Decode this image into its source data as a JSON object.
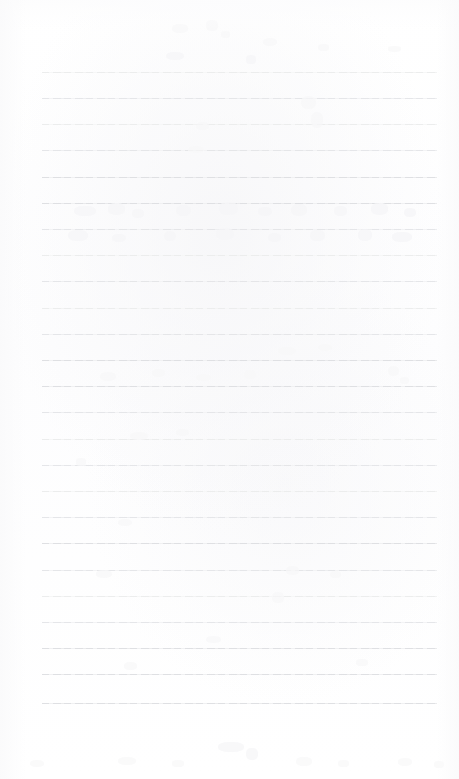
{
  "document": {
    "kind": "scanned-ruled-notepad-page",
    "title": "Blank Lined Paper Scan",
    "visible_text": "",
    "text_content_note": "no legible text present",
    "page_width": 459,
    "page_height": 779
  },
  "colors": {
    "page_background": "#fefefe",
    "paper_tint": "#fdfdfe",
    "rule_line": "#e8e9eb",
    "rule_line_dim": "#eceded",
    "rule_line_mid": "#e4e5e8",
    "rule_line_dark": "#dedfe2",
    "ghost_mark": "#f2f2f4"
  },
  "ruling": {
    "line_count": 25,
    "first_line_y": 72,
    "line_spacing": 26.2,
    "line_left_x": 42,
    "line_right_x": 437,
    "line_width": 395,
    "line_thickness": 1,
    "top_margin_height": 72,
    "bottom_margin_height": 76,
    "lines_y": [
      72,
      98,
      124,
      150,
      177,
      203,
      229,
      255,
      281,
      308,
      334,
      360,
      386,
      412,
      439,
      465,
      491,
      517,
      543,
      570,
      596,
      622,
      648,
      674,
      703
    ],
    "line_shades": [
      "dim",
      "mid",
      "dim",
      "mid",
      "dark",
      "dark",
      "mid",
      "dim",
      "mid",
      "dim",
      "mid",
      "dark",
      "dark",
      "mid",
      "dim",
      "mid",
      "dim",
      "mid",
      "dark",
      "mid",
      "dim",
      "mid",
      "dark",
      "dark",
      "dark"
    ]
  },
  "ghost_marks": [
    {
      "x": 172,
      "y": 24,
      "w": 16,
      "h": 9,
      "class": "faint"
    },
    {
      "x": 206,
      "y": 20,
      "w": 12,
      "h": 11,
      "class": "faint"
    },
    {
      "x": 221,
      "y": 31,
      "w": 9,
      "h": 7,
      "class": "faint"
    },
    {
      "x": 263,
      "y": 38,
      "w": 14,
      "h": 8,
      "class": "faint"
    },
    {
      "x": 318,
      "y": 44,
      "w": 11,
      "h": 7,
      "class": "faint"
    },
    {
      "x": 388,
      "y": 46,
      "w": 13,
      "h": 6,
      "class": "faint"
    },
    {
      "x": 166,
      "y": 52,
      "w": 18,
      "h": 8,
      "class": "soft"
    },
    {
      "x": 246,
      "y": 55,
      "w": 10,
      "h": 9,
      "class": "soft"
    },
    {
      "x": 301,
      "y": 96,
      "w": 15,
      "h": 13,
      "class": "faint"
    },
    {
      "x": 311,
      "y": 112,
      "w": 12,
      "h": 16,
      "class": "faint"
    },
    {
      "x": 196,
      "y": 122,
      "w": 13,
      "h": 8,
      "class": "faint"
    },
    {
      "x": 188,
      "y": 146,
      "w": 16,
      "h": 7,
      "class": "faint"
    },
    {
      "x": 74,
      "y": 206,
      "w": 22,
      "h": 10,
      "class": "soft"
    },
    {
      "x": 108,
      "y": 203,
      "w": 17,
      "h": 12,
      "class": "soft"
    },
    {
      "x": 132,
      "y": 209,
      "w": 12,
      "h": 9,
      "class": "soft"
    },
    {
      "x": 176,
      "y": 205,
      "w": 15,
      "h": 11,
      "class": "soft"
    },
    {
      "x": 219,
      "y": 202,
      "w": 19,
      "h": 13,
      "class": "soft"
    },
    {
      "x": 258,
      "y": 207,
      "w": 14,
      "h": 9,
      "class": "soft"
    },
    {
      "x": 291,
      "y": 204,
      "w": 16,
      "h": 12,
      "class": "soft"
    },
    {
      "x": 334,
      "y": 206,
      "w": 13,
      "h": 10,
      "class": "soft"
    },
    {
      "x": 371,
      "y": 203,
      "w": 17,
      "h": 12,
      "class": "soft"
    },
    {
      "x": 404,
      "y": 208,
      "w": 12,
      "h": 9,
      "class": "soft"
    },
    {
      "x": 68,
      "y": 230,
      "w": 20,
      "h": 11,
      "class": "soft"
    },
    {
      "x": 112,
      "y": 234,
      "w": 14,
      "h": 8,
      "class": "soft"
    },
    {
      "x": 164,
      "y": 231,
      "w": 12,
      "h": 10,
      "class": "soft"
    },
    {
      "x": 216,
      "y": 228,
      "w": 18,
      "h": 12,
      "class": "soft"
    },
    {
      "x": 268,
      "y": 233,
      "w": 13,
      "h": 9,
      "class": "soft"
    },
    {
      "x": 310,
      "y": 230,
      "w": 15,
      "h": 11,
      "class": "soft"
    },
    {
      "x": 358,
      "y": 229,
      "w": 14,
      "h": 12,
      "class": "soft"
    },
    {
      "x": 392,
      "y": 232,
      "w": 20,
      "h": 10,
      "class": "soft"
    },
    {
      "x": 278,
      "y": 347,
      "w": 18,
      "h": 8,
      "class": "faint"
    },
    {
      "x": 318,
      "y": 344,
      "w": 14,
      "h": 7,
      "class": "faint"
    },
    {
      "x": 100,
      "y": 372,
      "w": 16,
      "h": 9,
      "class": "faint"
    },
    {
      "x": 152,
      "y": 369,
      "w": 13,
      "h": 8,
      "class": "faint"
    },
    {
      "x": 196,
      "y": 374,
      "w": 15,
      "h": 7,
      "class": "faint"
    },
    {
      "x": 244,
      "y": 370,
      "w": 12,
      "h": 9,
      "class": "faint"
    },
    {
      "x": 388,
      "y": 366,
      "w": 11,
      "h": 10,
      "class": "faint"
    },
    {
      "x": 400,
      "y": 377,
      "w": 9,
      "h": 7,
      "class": "faint"
    },
    {
      "x": 130,
      "y": 432,
      "w": 18,
      "h": 8,
      "class": "faint"
    },
    {
      "x": 176,
      "y": 429,
      "w": 13,
      "h": 7,
      "class": "faint"
    },
    {
      "x": 76,
      "y": 458,
      "w": 10,
      "h": 8,
      "class": "faint"
    },
    {
      "x": 118,
      "y": 519,
      "w": 14,
      "h": 7,
      "class": "faint"
    },
    {
      "x": 96,
      "y": 570,
      "w": 16,
      "h": 8,
      "class": "faint"
    },
    {
      "x": 286,
      "y": 566,
      "w": 13,
      "h": 9,
      "class": "faint"
    },
    {
      "x": 330,
      "y": 571,
      "w": 11,
      "h": 7,
      "class": "faint"
    },
    {
      "x": 272,
      "y": 592,
      "w": 12,
      "h": 11,
      "class": "faint"
    },
    {
      "x": 206,
      "y": 636,
      "w": 15,
      "h": 7,
      "class": "faint"
    },
    {
      "x": 124,
      "y": 662,
      "w": 13,
      "h": 8,
      "class": "faint"
    },
    {
      "x": 356,
      "y": 659,
      "w": 12,
      "h": 7,
      "class": "faint"
    },
    {
      "x": 218,
      "y": 742,
      "w": 26,
      "h": 10,
      "class": "soft"
    },
    {
      "x": 246,
      "y": 748,
      "w": 12,
      "h": 12,
      "class": "soft"
    },
    {
      "x": 30,
      "y": 760,
      "w": 14,
      "h": 7,
      "class": "faint"
    },
    {
      "x": 118,
      "y": 757,
      "w": 18,
      "h": 8,
      "class": "faint"
    },
    {
      "x": 172,
      "y": 760,
      "w": 12,
      "h": 7,
      "class": "faint"
    },
    {
      "x": 296,
      "y": 757,
      "w": 16,
      "h": 9,
      "class": "faint"
    },
    {
      "x": 338,
      "y": 760,
      "w": 11,
      "h": 7,
      "class": "faint"
    },
    {
      "x": 398,
      "y": 758,
      "w": 14,
      "h": 8,
      "class": "faint"
    },
    {
      "x": 434,
      "y": 761,
      "w": 10,
      "h": 7,
      "class": "faint"
    }
  ]
}
